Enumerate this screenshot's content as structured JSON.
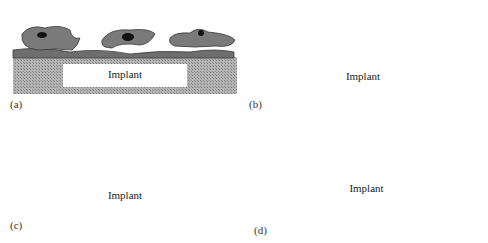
{
  "figure": {
    "panels": [
      {
        "id": "a",
        "label": "(a)",
        "implant_label": "Implant",
        "description": "Cells adhering and spreading on implant surface"
      },
      {
        "id": "b",
        "label": "(b)",
        "implant_label": "Implant",
        "description": "Cell layer secreting factors (arrows with particles)"
      },
      {
        "id": "c",
        "label": "(c)",
        "implant_label": "Implant",
        "description": "Additional cells depositing fibrous matrix onto cell layer"
      },
      {
        "id": "d",
        "label": "(d)",
        "implant_label": "Implant",
        "description": "Implant encapsulated by fibrous capsule"
      }
    ],
    "colors": {
      "cell_fill": "#7a7a7a",
      "cell_outline": "#3a3a3a",
      "nucleus": "#111111",
      "implant_hatch": "#9a9a9a",
      "implant_box": "#ffffff",
      "particle": "#a0a0a0"
    }
  }
}
